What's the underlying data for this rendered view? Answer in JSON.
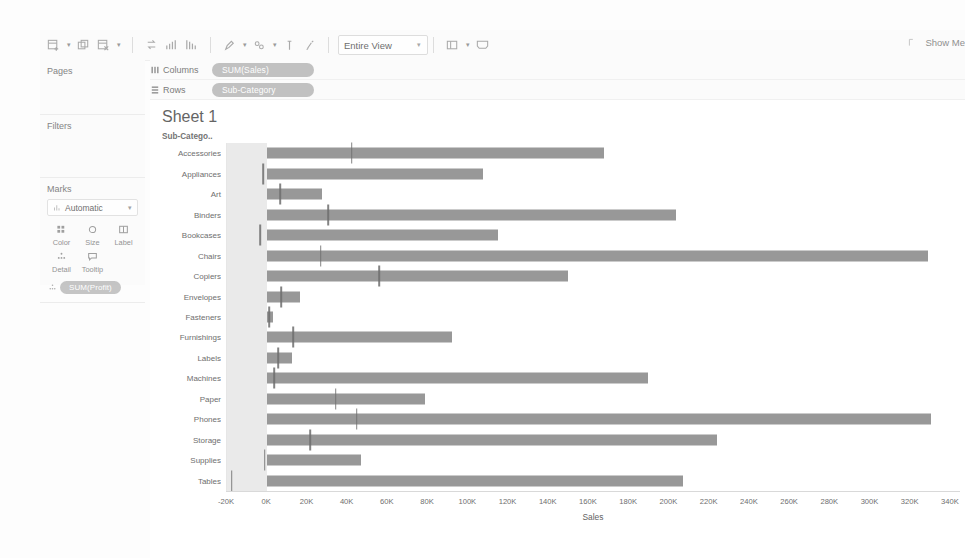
{
  "toolbar": {
    "groups": [
      [
        {
          "icon": "new-worksheet-icon",
          "caret": true
        },
        {
          "icon": "duplicate-sheet-icon",
          "caret": false
        },
        {
          "icon": "clear-sheet-icon",
          "caret": true
        }
      ],
      [
        {
          "icon": "swap-rows-columns-icon",
          "caret": false
        },
        {
          "icon": "sort-ascending-icon",
          "caret": false
        },
        {
          "icon": "sort-descending-icon",
          "caret": false
        }
      ],
      [
        {
          "icon": "highlight-icon",
          "caret": true
        },
        {
          "icon": "group-members-icon",
          "caret": true
        },
        {
          "icon": "show-mark-labels-icon",
          "caret": false
        },
        {
          "icon": "fix-axes-icon",
          "caret": false
        }
      ]
    ],
    "fit_select": "Entire View",
    "after_fit": [
      {
        "icon": "show-hide-cards-icon",
        "caret": true
      },
      {
        "icon": "presentation-mode-icon",
        "caret": false
      }
    ],
    "show_me_label": "Show Me",
    "show_me_icon": "show-me-icon"
  },
  "left_panel": {
    "pages": {
      "title": "Pages"
    },
    "filters": {
      "title": "Filters"
    },
    "marks": {
      "title": "Marks",
      "mark_type": "Automatic",
      "mark_type_icon": "bar-mark-icon",
      "buttons": [
        {
          "label": "Color",
          "icon": "color-icon"
        },
        {
          "label": "Size",
          "icon": "size-icon"
        },
        {
          "label": "Label",
          "icon": "label-icon"
        },
        {
          "label": "Detail",
          "icon": "detail-icon"
        },
        {
          "label": "Tooltip",
          "icon": "tooltip-icon"
        }
      ],
      "encoding_pill": "SUM(Profit)",
      "encoding_pill_icon": "detail-icon"
    }
  },
  "shelves": [
    {
      "label": "Columns",
      "icon": "columns-icon",
      "pill": "SUM(Sales)"
    },
    {
      "label": "Rows",
      "icon": "rows-icon",
      "pill": "Sub-Category"
    }
  ],
  "view": {
    "sheet_title": "Sheet 1",
    "row_header": "Sub-Catego.."
  },
  "colors": {
    "bar": "#8f8f8f",
    "reference_line": "#6d6d6d",
    "negative_band": "#e3e3e3",
    "pill": "#b5b5b5"
  },
  "chart_data": {
    "type": "bar",
    "title": "Sheet 1",
    "xlabel": "Sales",
    "ylabel": "Sub-Category",
    "xlim": [
      -20000,
      345000
    ],
    "xticks": [
      "-20K",
      "0K",
      "20K",
      "40K",
      "60K",
      "80K",
      "100K",
      "120K",
      "140K",
      "160K",
      "180K",
      "200K",
      "220K",
      "240K",
      "260K",
      "280K",
      "300K",
      "320K",
      "340K"
    ],
    "xtick_values": [
      -20000,
      0,
      20000,
      40000,
      60000,
      80000,
      100000,
      120000,
      140000,
      160000,
      180000,
      200000,
      220000,
      240000,
      260000,
      280000,
      300000,
      320000,
      340000
    ],
    "grid": false,
    "legend": "none",
    "categories": [
      "Accessories",
      "Appliances",
      "Art",
      "Binders",
      "Bookcases",
      "Chairs",
      "Copiers",
      "Envelopes",
      "Fasteners",
      "Furnishings",
      "Labels",
      "Machines",
      "Paper",
      "Phones",
      "Storage",
      "Supplies",
      "Tables"
    ],
    "series": [
      {
        "name": "SUM(Sales)",
        "type": "bar",
        "values": [
          167380,
          107532,
          27119,
          203413,
          114880,
          328449,
          149528,
          16476,
          3024,
          91705,
          12486,
          189239,
          78479,
          330007,
          223844,
          46674,
          206966
        ]
      },
      {
        "name": "SUM(Profit)",
        "type": "reference-line",
        "values": [
          41937,
          -2000,
          6528,
          30222,
          -3473,
          26590,
          55618,
          6964,
          950,
          13060,
          5546,
          3385,
          34054,
          44516,
          21279,
          -1189,
          -17725
        ]
      }
    ]
  }
}
